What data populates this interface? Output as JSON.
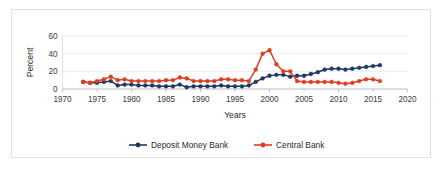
{
  "chart_data": {
    "type": "line",
    "title": "",
    "xlabel": "Years",
    "ylabel": "Percent",
    "xlim": [
      1970,
      2020
    ],
    "ylim": [
      0,
      60
    ],
    "xticks": [
      1970,
      1975,
      1980,
      1985,
      1990,
      1995,
      2000,
      2005,
      2010,
      2015,
      2020
    ],
    "yticks": [
      0,
      20,
      40,
      60
    ],
    "grid": "horizontal",
    "legend_position": "bottom",
    "x": [
      1973,
      1974,
      1975,
      1976,
      1977,
      1978,
      1979,
      1980,
      1981,
      1982,
      1983,
      1984,
      1985,
      1986,
      1987,
      1988,
      1989,
      1990,
      1991,
      1992,
      1993,
      1994,
      1995,
      1996,
      1997,
      1998,
      1999,
      2000,
      2001,
      2002,
      2003,
      2004,
      2005,
      2006,
      2007,
      2008,
      2009,
      2010,
      2011,
      2012,
      2013,
      2014,
      2015,
      2016
    ],
    "series": [
      {
        "name": "Deposit Money Bank",
        "color": "#1F3864",
        "marker": "circle",
        "values": [
          8,
          7,
          7,
          8,
          9,
          4,
          5,
          5,
          4,
          4,
          4,
          3,
          3,
          3,
          5,
          2,
          3,
          3,
          3,
          3,
          4,
          3,
          3,
          3,
          4,
          8,
          12,
          15,
          16,
          16,
          14,
          15,
          15,
          17,
          19,
          22,
          23,
          23,
          22,
          23,
          24,
          25,
          26,
          27
        ]
      },
      {
        "name": "Central Bank",
        "color": "#E03C1F",
        "marker": "circle",
        "values": [
          8,
          7,
          9,
          11,
          14,
          10,
          11,
          9,
          9,
          9,
          9,
          9,
          10,
          10,
          13,
          12,
          9,
          9,
          9,
          9,
          11,
          11,
          10,
          10,
          9,
          22,
          40,
          44,
          28,
          20,
          20,
          9,
          8,
          8,
          8,
          8,
          8,
          7,
          6,
          7,
          9,
          11,
          11,
          9
        ]
      }
    ]
  },
  "legend": {
    "items": [
      {
        "label": "Deposit Money Bank",
        "color": "#1F3864"
      },
      {
        "label": "Central Bank",
        "color": "#E03C1F"
      }
    ]
  },
  "axis": {
    "y_title": "Percent",
    "x_title": "Years",
    "y_tick_labels": [
      "0",
      "20",
      "40",
      "60"
    ],
    "x_tick_labels": [
      "1970",
      "1975",
      "1980",
      "1985",
      "1990",
      "1995",
      "2000",
      "2005",
      "2010",
      "2015",
      "2020"
    ]
  }
}
